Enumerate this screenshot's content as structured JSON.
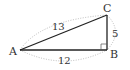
{
  "diagram": {
    "type": "right-triangle",
    "vertices": {
      "A": {
        "label": "A",
        "x": 20,
        "y": 50
      },
      "B": {
        "label": "B",
        "x": 107,
        "y": 50
      },
      "C": {
        "label": "C",
        "x": 107,
        "y": 15
      }
    },
    "sides": {
      "AC": {
        "label": "13"
      },
      "BC": {
        "label": "5"
      },
      "AB": {
        "label": "12"
      }
    },
    "right_angle_at": "B",
    "colors": {
      "line": "#222222",
      "dotted": "#aaaaaa",
      "text": "#333333"
    }
  }
}
